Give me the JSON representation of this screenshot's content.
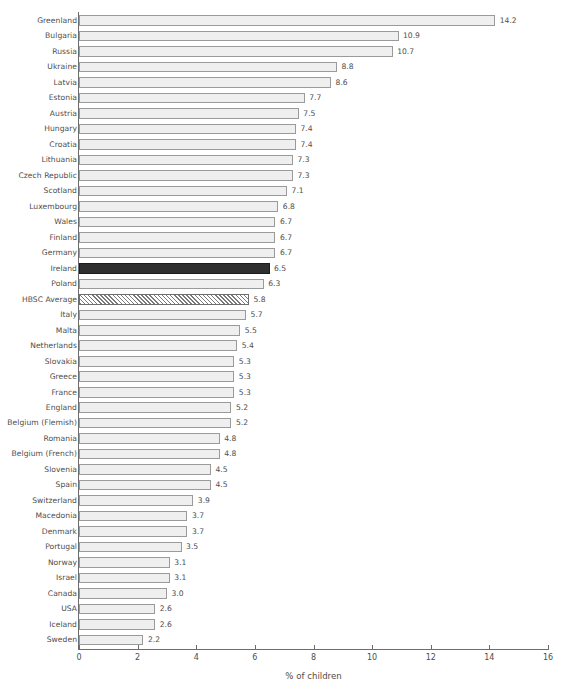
{
  "chart_data": {
    "type": "bar",
    "orientation": "horizontal",
    "title": "",
    "xlabel": "% of children",
    "ylabel": "",
    "xlim": [
      0,
      16
    ],
    "xticks": [
      0,
      2,
      4,
      6,
      8,
      10,
      12,
      14,
      16
    ],
    "xtick_labels": [
      "0",
      "2",
      "4",
      "6",
      "8",
      "10",
      "12",
      "14",
      "16"
    ],
    "grid": false,
    "legend": null,
    "value_label_format": "one_decimal",
    "categories": [
      "Greenland",
      "Bulgaria",
      "Russia",
      "Ukraine",
      "Latvia",
      "Estonia",
      "Austria",
      "Hungary",
      "Croatia",
      "Lithuania",
      "Czech Republic",
      "Scotland",
      "Luxembourg",
      "Wales",
      "Finland",
      "Germany",
      "Ireland",
      "Poland",
      "HBSC Average",
      "Italy",
      "Malta",
      "Netherlands",
      "Slovakia",
      "Greece",
      "France",
      "England",
      "Belgium (Flemish)",
      "Romania",
      "Belgium (French)",
      "Slovenia",
      "Spain",
      "Switzerland",
      "Macedonia",
      "Denmark",
      "Portugal",
      "Norway",
      "Israel",
      "Canada",
      "USA",
      "Iceland",
      "Sweden"
    ],
    "values": [
      14.2,
      10.9,
      10.7,
      8.8,
      8.6,
      7.7,
      7.5,
      7.4,
      7.4,
      7.3,
      7.3,
      7.1,
      6.8,
      6.7,
      6.7,
      6.7,
      6.5,
      6.3,
      5.8,
      5.7,
      5.5,
      5.4,
      5.3,
      5.3,
      5.3,
      5.2,
      5.2,
      4.8,
      4.8,
      4.5,
      4.5,
      3.9,
      3.7,
      3.7,
      3.5,
      3.1,
      3.1,
      3.0,
      2.6,
      2.6,
      2.2
    ],
    "value_labels": [
      "14.2",
      "10.9",
      "10.7",
      "8.8",
      "8.6",
      "7.7",
      "7.5",
      "7.4",
      "7.4",
      "7.3",
      "7.3",
      "7.1",
      "6.8",
      "6.7",
      "6.7",
      "6.7",
      "6.5",
      "6.3",
      "5.8",
      "5.7",
      "5.5",
      "5.4",
      "5.3",
      "5.3",
      "5.3",
      "5.2",
      "5.2",
      "4.8",
      "4.8",
      "4.5",
      "4.5",
      "3.9",
      "3.7",
      "3.7",
      "3.5",
      "3.1",
      "3.1",
      "3.0",
      "2.6",
      "2.6",
      "2.2"
    ],
    "bar_styles": [
      "plain",
      "plain",
      "plain",
      "plain",
      "plain",
      "plain",
      "plain",
      "plain",
      "plain",
      "plain",
      "plain",
      "plain",
      "plain",
      "plain",
      "plain",
      "plain",
      "highlight",
      "plain",
      "hatched",
      "plain",
      "plain",
      "plain",
      "plain",
      "plain",
      "plain",
      "plain",
      "plain",
      "plain",
      "plain",
      "plain",
      "plain",
      "plain",
      "plain",
      "plain",
      "plain",
      "plain",
      "plain",
      "plain",
      "plain",
      "plain",
      "plain"
    ],
    "colors": {
      "bar_fill": "#efefef",
      "bar_stroke": "#9a9a9a",
      "highlight_fill": "#2f2f2f",
      "hatch_stroke": "#7a7a7a",
      "axis": "#6d6d6d",
      "text": "#4d4d4d",
      "background": "#ffffff"
    }
  }
}
